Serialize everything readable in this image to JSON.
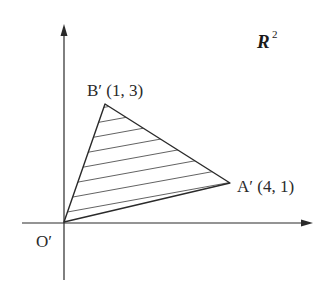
{
  "diagram": {
    "space_label": "R",
    "space_superscript": "2",
    "origin": {
      "label": "O′",
      "coords": [
        0,
        0
      ]
    },
    "points": [
      {
        "name": "B′",
        "label": "B′ (1, 3)",
        "coords": [
          1,
          3
        ]
      },
      {
        "name": "A′",
        "label": "A′ (4, 1)",
        "coords": [
          4,
          1
        ]
      }
    ],
    "shape": "triangle O′A′B′ (hatched)",
    "axes": {
      "x_arrow": true,
      "y_arrow": true
    },
    "colors": {
      "stroke": "#2a2a2a",
      "background": "#ffffff"
    }
  }
}
